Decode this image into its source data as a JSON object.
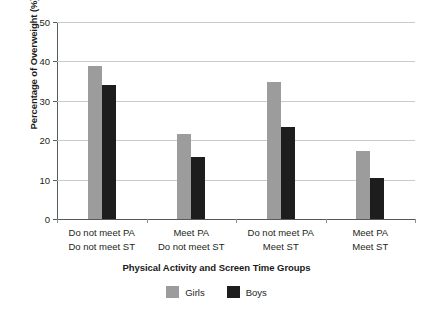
{
  "chart_data": {
    "type": "bar",
    "title": "",
    "xlabel": "Physical Activity and Screen Time Groups",
    "ylabel": "Percentage of Overweight (%)",
    "ylim": [
      0,
      50
    ],
    "yticks": [
      0,
      10,
      20,
      30,
      40,
      50
    ],
    "ytick_labels": [
      "0",
      "10",
      "20",
      "30",
      "40",
      "50"
    ],
    "grid": true,
    "legend_position": "bottom",
    "categories": [
      "Do not meet PA\nDo not meet ST",
      "Meet PA\nDo not meet ST",
      "Do not meet PA\nMeet ST",
      "Meet PA\nMeet ST"
    ],
    "category_lines": [
      {
        "line1": "Do not meet PA",
        "line2": "Do not meet ST"
      },
      {
        "line1": "Meet PA",
        "line2": "Do not meet ST"
      },
      {
        "line1": "Do not meet PA",
        "line2": "Meet ST"
      },
      {
        "line1": "Meet PA",
        "line2": "Meet ST"
      }
    ],
    "series": [
      {
        "name": "Girls",
        "color": "#9c9c9c",
        "values": [
          38.8,
          21.6,
          34.8,
          17.2
        ]
      },
      {
        "name": "Boys",
        "color": "#1d1d1d",
        "values": [
          34.1,
          15.8,
          23.3,
          10.4
        ]
      }
    ]
  },
  "legend": {
    "items": [
      {
        "label": "Girls",
        "color": "#9c9c9c"
      },
      {
        "label": "Boys",
        "color": "#1d1d1d"
      }
    ]
  }
}
